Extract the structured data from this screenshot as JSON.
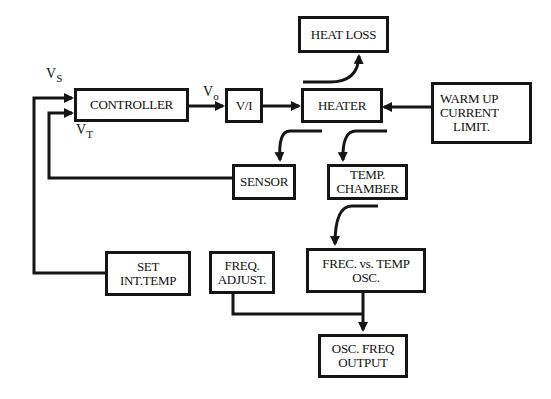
{
  "diagram": {
    "type": "block-diagram",
    "blocks": {
      "heat_loss": [
        "HEAT LOSS"
      ],
      "controller": [
        "CONTROLLER"
      ],
      "v_to_i": [
        "V/I"
      ],
      "heater": [
        "HEATER"
      ],
      "warm_up": [
        "WARM UP",
        "CURRENT",
        "LIMIT."
      ],
      "sensor": [
        "SENSOR"
      ],
      "temp_chamber": [
        "TEMP.",
        "CHAMBER"
      ],
      "set_int_temp": [
        "SET",
        "INT.TEMP"
      ],
      "freq_adjust": [
        "FREQ.",
        "ADJUST."
      ],
      "freq_vs_temp_osc": [
        "FREC. vs. TEMP",
        "OSC."
      ],
      "osc_freq_output": [
        "OSC. FREQ",
        "OUTPUT"
      ]
    },
    "signals": {
      "vs": {
        "main": "V",
        "sub": "S"
      },
      "vt": {
        "main": "V",
        "sub": "T"
      },
      "vo": {
        "main": "V",
        "sub": "o"
      }
    },
    "edges": [
      {
        "from": "set_int_temp",
        "to": "controller",
        "label": "Vs"
      },
      {
        "from": "sensor",
        "to": "controller",
        "label": "VT"
      },
      {
        "from": "controller",
        "to": "v_to_i",
        "label": "Vo"
      },
      {
        "from": "v_to_i",
        "to": "heater"
      },
      {
        "from": "warm_up",
        "to": "heater"
      },
      {
        "from": "heater",
        "to": "heat_loss"
      },
      {
        "from": "heater",
        "to": "sensor"
      },
      {
        "from": "heater",
        "to": "temp_chamber"
      },
      {
        "from": "temp_chamber",
        "to": "freq_vs_temp_osc"
      },
      {
        "from": "freq_vs_temp_osc",
        "to": "osc_freq_output"
      },
      {
        "from": "freq_adjust",
        "to": "osc_freq_output"
      }
    ],
    "colors": {
      "line": "#151515",
      "background": "#ffffff"
    }
  }
}
